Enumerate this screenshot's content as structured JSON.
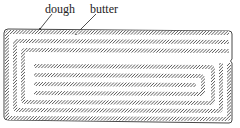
{
  "diagram": {
    "type": "laminated-dough-cross-section",
    "labels": {
      "dough": "dough",
      "butter": "butter"
    },
    "colors": {
      "outline": "#333333",
      "butter_hatch": "#555555",
      "background": "#ffffff"
    }
  }
}
